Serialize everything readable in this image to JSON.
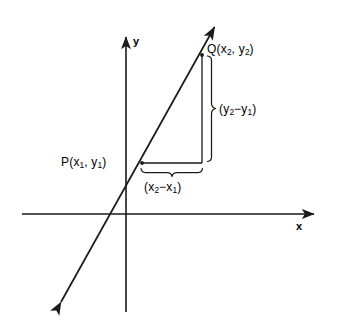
{
  "figure": {
    "background_color": "#ffffff",
    "stroke_color": "#1a1a1a"
  },
  "axes": {
    "x_label": "x",
    "y_label": "y",
    "origin": {
      "x": 126,
      "y": 214
    },
    "x_axis": {
      "x_start": 22,
      "x_end": 318,
      "y": 214,
      "arrow_end": "right"
    },
    "y_axis": {
      "y_start": 33,
      "y_end": 312,
      "x": 126,
      "arrow_end": "top"
    }
  },
  "line": {
    "name": "secant-line-PQ",
    "arrow_start": {
      "x": 57,
      "y": 309
    },
    "arrow_end": {
      "x": 218,
      "y": 22
    },
    "double_headed": true
  },
  "points": [
    {
      "id": "P",
      "label": "P(x",
      "label_full": "P(x1, y1)",
      "sub1": "1",
      "mid": ", y",
      "sub2": "1",
      "close": ")",
      "x": 142,
      "y": 163
    },
    {
      "id": "Q",
      "label": "Q(x",
      "label_full": "Q(x2, y2)",
      "sub1": "2",
      "mid": ", y",
      "sub2": "2",
      "close": ")",
      "x": 202,
      "y": 55
    }
  ],
  "brackets": {
    "vertical": {
      "name": "delta-y-brace",
      "open": "(y",
      "sub1": "2",
      "minus": "−y",
      "sub2": "1",
      "close": ")",
      "label_full": "(y2−y1)",
      "from_y": 55,
      "to_y": 163,
      "x": 212
    },
    "horizontal": {
      "name": "delta-x-brace",
      "open": "(x",
      "sub1": "2",
      "minus": "−x",
      "sub2": "1",
      "close": ")",
      "label_full": "(x2−x1)",
      "from_x": 142,
      "to_x": 202,
      "y": 172
    }
  }
}
